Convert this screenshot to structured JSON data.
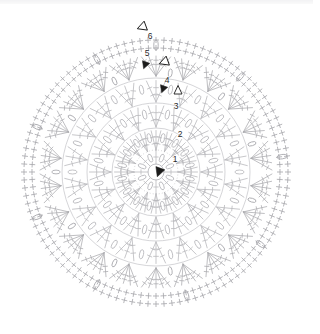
{
  "document": {
    "kind": "crochet-stitch-chart",
    "title": "Round crochet motif chart",
    "background_color": "#ffffff",
    "stitch_line_color": "#b9b9bd",
    "stitch_line_color_outer": "#a9a9ae",
    "marker_color": "#1b1b1b",
    "label_color": "#2b2b2b"
  },
  "canvas": {
    "width": 313,
    "height": 334,
    "center_x": 156,
    "center_y": 172,
    "outer_radius": 136
  },
  "round_labels": [
    {
      "text": "1",
      "x": 175,
      "y": 162
    },
    {
      "text": "2",
      "x": 180,
      "y": 137
    },
    {
      "text": "3",
      "x": 176,
      "y": 109
    },
    {
      "text": "4",
      "x": 167,
      "y": 83
    },
    {
      "text": "5",
      "x": 147,
      "y": 56
    },
    {
      "text": "6",
      "x": 150,
      "y": 39
    }
  ],
  "markers": [
    {
      "name": "start-marker-filled-triangle",
      "shape": "triangle-filled",
      "x": 159,
      "y": 172,
      "rotation": 200,
      "size": 5
    },
    {
      "name": "round4-start-filled-triangle",
      "shape": "triangle-filled",
      "x": 163,
      "y": 89,
      "rotation": 200,
      "size": 4
    },
    {
      "name": "round5-start-filled-triangle",
      "shape": "triangle-filled",
      "x": 145,
      "y": 65,
      "rotation": 200,
      "size": 4
    },
    {
      "name": "round4-end-open-triangle",
      "shape": "triangle-open",
      "x": 164,
      "y": 62,
      "rotation": 250,
      "size": 5
    },
    {
      "name": "round6-end-open-triangle",
      "shape": "triangle-open",
      "x": 142,
      "y": 27,
      "rotation": 250,
      "size": 5
    },
    {
      "name": "round3-open-chevron",
      "shape": "chevron-open",
      "x": 178,
      "y": 90,
      "rotation": 180,
      "size": 5
    }
  ],
  "rounds": [
    {
      "index": 1,
      "radius_inner": 8,
      "radius_outer": 22,
      "spokes": 8,
      "style": "center-ring-spokes",
      "stitch": "dc"
    },
    {
      "index": 2,
      "radius_inner": 22,
      "radius_outer": 45,
      "spokes": 16,
      "style": "fan-cluster",
      "stitch": "tr"
    },
    {
      "index": 3,
      "radius_inner": 45,
      "radius_outer": 70,
      "spokes": 16,
      "style": "fan-cluster",
      "stitch": "tr"
    },
    {
      "index": 4,
      "radius_inner": 70,
      "radius_outer": 95,
      "spokes": 18,
      "style": "fan-cluster",
      "stitch": "tr"
    },
    {
      "index": 5,
      "radius_inner": 95,
      "radius_outer": 118,
      "spokes": 22,
      "style": "fan-spray",
      "stitch": "tr"
    },
    {
      "index": 6,
      "radius_inner": 118,
      "radius_outer": 136,
      "spokes": 26,
      "style": "sc-edging",
      "stitch": "sc"
    }
  ],
  "chart_data": {
    "type": "diagram",
    "subtype": "concentric-rounds",
    "round_count": 6,
    "labels": [
      "1",
      "2",
      "3",
      "4",
      "5",
      "6"
    ],
    "symbols": {
      "plus": "single crochet (sc)",
      "oval": "chain loop (ch)",
      "long-line-with-bars": "treble crochet (tr)",
      "filled-triangle": "round start",
      "open-triangle": "round end",
      "open-chevron": "join / direction"
    }
  }
}
